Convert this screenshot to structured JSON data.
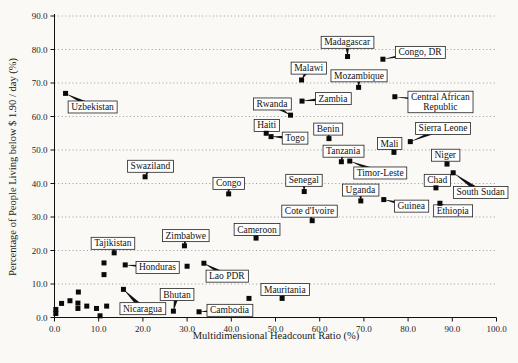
{
  "chart_data": {
    "type": "scatter",
    "xlabel": "Multidimensional Headcount Ratio (%)",
    "ylabel": "Percentage of People Living below $ 1.90 / day (%)",
    "xlim": [
      0,
      100
    ],
    "ylim": [
      0,
      90
    ],
    "xtick_labels": [
      "0.0",
      "10.0",
      "20.0",
      "30.0",
      "40.0",
      "50.0",
      "60.0",
      "70.0",
      "80.0",
      "90.0",
      "100.0"
    ],
    "ytick_labels": [
      "0.0",
      "10.0",
      "20.0",
      "30.0",
      "40.0",
      "50.0",
      "60.0",
      "70.0",
      "80.0",
      "90.0"
    ],
    "grid": "horizontal-dotted",
    "legend": "none",
    "marker": {
      "shape": "square",
      "color": "#0a0a0a",
      "size": 5
    },
    "colors": {
      "grid": "#999999",
      "axis": "#111111",
      "label_box_bg": "#ffffff",
      "label_box_border": "#222222",
      "background": "#faf9f6",
      "text": "#1a1a1a"
    },
    "labeled_points": [
      {
        "label": "Uzbekistan",
        "x": 2.5,
        "y": 66.9,
        "label_at": [
          8.6,
          62.9
        ]
      },
      {
        "label": "Swaziland",
        "x": 20.5,
        "y": 42.0,
        "label_at": [
          21.7,
          45.2
        ]
      },
      {
        "label": "Madagascar",
        "x": 66.3,
        "y": 77.9,
        "label_at": [
          66.2,
          82.2
        ]
      },
      {
        "label": "Congo, DR",
        "x": 74.3,
        "y": 77.1,
        "label_at": [
          82.7,
          79.2
        ]
      },
      {
        "label": "Malawi",
        "x": 55.9,
        "y": 70.9,
        "label_at": [
          57.5,
          74.5
        ]
      },
      {
        "label": "Mozambique",
        "x": 68.8,
        "y": 68.7,
        "label_at": [
          68.9,
          72.2
        ]
      },
      {
        "label": "Zambia",
        "x": 56.0,
        "y": 64.6,
        "label_at": [
          63.0,
          65.4
        ]
      },
      {
        "label": "Central African\nRepublic",
        "x": 77.0,
        "y": 65.9,
        "label_at": [
          87.3,
          64.4
        ]
      },
      {
        "label": "Rwanda",
        "x": 53.4,
        "y": 60.4,
        "label_at": [
          49.2,
          63.8
        ]
      },
      {
        "label": "Haiti",
        "x": 47.9,
        "y": 55.0,
        "label_at": [
          48.0,
          57.4
        ]
      },
      {
        "label": "Togo",
        "x": 49.0,
        "y": 54.0,
        "label_at": [
          54.4,
          53.6
        ]
      },
      {
        "label": "Benin",
        "x": 62.1,
        "y": 53.4,
        "label_at": [
          61.9,
          56.3
        ]
      },
      {
        "label": "Mali",
        "x": 76.8,
        "y": 49.3,
        "label_at": [
          75.8,
          52.0
        ]
      },
      {
        "label": "Sierra Leone",
        "x": 80.5,
        "y": 52.5,
        "label_at": [
          87.9,
          56.5
        ]
      },
      {
        "label": "Tanzania",
        "x": 64.9,
        "y": 46.5,
        "label_at": [
          65.3,
          49.7
        ]
      },
      {
        "label": "Timor-Leste",
        "x": 66.8,
        "y": 46.7,
        "label_at": [
          73.7,
          43.2
        ]
      },
      {
        "label": "Niger",
        "x": 88.8,
        "y": 45.8,
        "label_at": [
          88.4,
          48.5
        ]
      },
      {
        "label": "Chad",
        "x": 86.3,
        "y": 38.7,
        "label_at": [
          86.6,
          41.0
        ]
      },
      {
        "label": "South Sudan",
        "x": 90.2,
        "y": 43.2,
        "label_at": [
          96.4,
          37.4
        ]
      },
      {
        "label": "Congo",
        "x": 39.4,
        "y": 36.9,
        "label_at": [
          39.4,
          40.1
        ]
      },
      {
        "label": "Senegal",
        "x": 56.5,
        "y": 37.6,
        "label_at": [
          56.4,
          41.0
        ]
      },
      {
        "label": "Uganda",
        "x": 69.3,
        "y": 34.8,
        "label_at": [
          69.2,
          38.1
        ]
      },
      {
        "label": "Guinea",
        "x": 74.5,
        "y": 35.2,
        "label_at": [
          80.7,
          33.3
        ]
      },
      {
        "label": "Cote d'Ivoire",
        "x": 58.3,
        "y": 28.9,
        "label_at": [
          57.7,
          31.8
        ]
      },
      {
        "label": "Ethiopia",
        "x": 87.2,
        "y": 34.1,
        "label_at": [
          90.1,
          31.9
        ]
      },
      {
        "label": "Cameroon",
        "x": 45.6,
        "y": 23.7,
        "label_at": [
          45.8,
          26.3
        ]
      },
      {
        "label": "Zimbabwe",
        "x": 29.4,
        "y": 21.4,
        "label_at": [
          29.7,
          24.5
        ]
      },
      {
        "label": "Tajikistan",
        "x": 13.5,
        "y": 19.3,
        "label_at": [
          13.2,
          22.2
        ]
      },
      {
        "label": "Honduras",
        "x": 16.0,
        "y": 15.7,
        "label_at": [
          23.3,
          15.0
        ]
      },
      {
        "label": "Lao PDR",
        "x": 33.8,
        "y": 16.2,
        "label_at": [
          39.0,
          12.4
        ]
      },
      {
        "label": "Nicaragua",
        "x": 15.6,
        "y": 8.4,
        "label_at": [
          19.9,
          2.7
        ]
      },
      {
        "label": "Bhutan",
        "x": 26.9,
        "y": 1.9,
        "label_at": [
          27.7,
          6.9
        ]
      },
      {
        "label": "Cambodia",
        "x": 32.7,
        "y": 1.7,
        "label_at": [
          39.6,
          2.2
        ]
      },
      {
        "label": "Mauritania",
        "x": 51.5,
        "y": 5.7,
        "label_at": [
          52.1,
          8.4
        ]
      }
    ],
    "unlabeled_points": [
      [
        0.3,
        1.2
      ],
      [
        0.3,
        2.4
      ],
      [
        1.6,
        4.2
      ],
      [
        3.5,
        5.0
      ],
      [
        5.4,
        7.6
      ],
      [
        5.3,
        4.3
      ],
      [
        5.3,
        2.7
      ],
      [
        7.3,
        3.4
      ],
      [
        9.5,
        2.7
      ],
      [
        10.3,
        0.5
      ],
      [
        11.8,
        3.4
      ],
      [
        11.2,
        16.3
      ],
      [
        11.2,
        12.8
      ],
      [
        30.0,
        15.3
      ],
      [
        44.0,
        5.7
      ]
    ]
  }
}
